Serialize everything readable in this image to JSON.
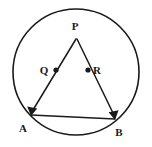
{
  "figure": {
    "background_color": "#ffffff",
    "stroke_color": "#1a1a1a",
    "width": 152,
    "height": 147
  },
  "circle": {
    "name": "circumscribed-circle",
    "center_x": 76,
    "center_y": 72,
    "radius": 63,
    "stroke_width": 1.6
  },
  "points": [
    {
      "id": "P",
      "label": "P",
      "x": 76,
      "y": 38,
      "label_x": 75,
      "label_y": 30,
      "marker": "none"
    },
    {
      "id": "Q",
      "label": "Q",
      "x": 56,
      "y": 70,
      "label_x": 44,
      "label_y": 74,
      "marker": "dot"
    },
    {
      "id": "R",
      "label": "R",
      "x": 88,
      "y": 70,
      "label_x": 97,
      "label_y": 74,
      "marker": "dot"
    },
    {
      "id": "A",
      "label": "A",
      "x": 31,
      "y": 115,
      "label_x": 23,
      "label_y": 132,
      "marker": "arrow"
    },
    {
      "id": "B",
      "label": "B",
      "x": 115,
      "y": 119,
      "label_x": 117,
      "label_y": 136,
      "marker": "arrow"
    }
  ],
  "segments": [
    {
      "id": "PA",
      "name": "segment-p-a",
      "from": "P",
      "to": "A",
      "arrow_at_end": true
    },
    {
      "id": "PB",
      "name": "segment-p-b",
      "from": "P",
      "to": "B",
      "arrow_at_end": true
    },
    {
      "id": "AB",
      "name": "segment-a-b",
      "from": "A",
      "to": "B",
      "arrow_at_end": false
    }
  ],
  "marker_dot_radius": 2.6,
  "labels": {
    "P": "P",
    "Q": "Q",
    "R": "R",
    "A": "A",
    "B": "B"
  }
}
